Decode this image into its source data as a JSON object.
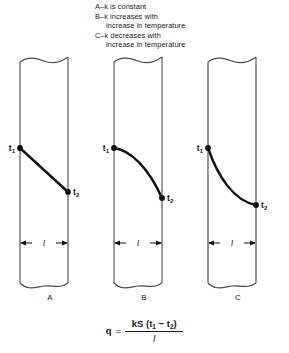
{
  "legend": {
    "lines": [
      {
        "text": "A–k is constant",
        "continuation": false
      },
      {
        "text": "B–k increases with",
        "continuation": false
      },
      {
        "text": "increase in temperature",
        "continuation": true
      },
      {
        "text": "C–k decreases with",
        "continuation": false
      },
      {
        "text": "increase in temperature",
        "continuation": true
      }
    ]
  },
  "panels": [
    {
      "id": "A",
      "label": "A",
      "curve_type": "straight",
      "description": "k is constant",
      "t1_label": "t",
      "t1_sub": "1",
      "t2_label": "t",
      "t2_sub": "2",
      "dimension_label": "l"
    },
    {
      "id": "B",
      "label": "B",
      "curve_type": "concave-down",
      "description": "k increases with increase in temperature",
      "t1_label": "t",
      "t1_sub": "1",
      "t2_label": "t",
      "t2_sub": "2",
      "dimension_label": "l"
    },
    {
      "id": "C",
      "label": "C",
      "curve_type": "convex-down",
      "description": "k decreases with increase in temperature",
      "t1_label": "t",
      "t1_sub": "1",
      "t2_label": "t",
      "t2_sub": "2",
      "dimension_label": "l"
    }
  ],
  "formula": {
    "lhs": "q",
    "equals": "=",
    "numerator_prefix": "kS (t",
    "numerator_sub1": "1",
    "numerator_mid": " − t",
    "numerator_sub2": "2",
    "numerator_suffix": ")",
    "denominator": "l",
    "plain": "q = kS (t1 − t2) / l"
  },
  "colors": {
    "ink": "#1a1a1a",
    "wall": "#4a4a4a",
    "background": "#ffffff"
  }
}
